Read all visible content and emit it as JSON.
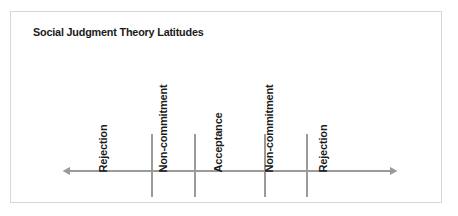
{
  "figure": {
    "title": "Social Judgment Theory Latitudes",
    "frame_border_color": "#d6d6d6",
    "background_color": "#ffffff",
    "text_color": "#1a1a1a",
    "line_color": "#9a9a9a"
  },
  "chart_data": {
    "type": "diagram",
    "title": "Social Judgment Theory Latitudes",
    "xlabel": "",
    "ylabel": "",
    "axis": {
      "orientation": "horizontal",
      "style": "double-headed-arrow",
      "color": "#9a9a9a",
      "start_x": 68,
      "end_x": 390,
      "y": 170
    },
    "grid": false,
    "legend": null,
    "tick_marks": [
      {
        "x": 150
      },
      {
        "x": 193
      },
      {
        "x": 263
      },
      {
        "x": 305
      }
    ],
    "categories": [
      "Rejection",
      "Non-commitment",
      "Acceptance",
      "Non-commitment",
      "Rejection"
    ],
    "regions": [
      {
        "label": "Rejection",
        "label_x": 108,
        "label_y": 160
      },
      {
        "label": "Non-commitment",
        "label_x": 168,
        "label_y": 160
      },
      {
        "label": "Acceptance",
        "label_x": 223,
        "label_y": 160
      },
      {
        "label": "Non-commitment",
        "label_x": 274,
        "label_y": 160
      },
      {
        "label": "Rejection",
        "label_x": 328,
        "label_y": 160
      }
    ],
    "annotations": []
  }
}
